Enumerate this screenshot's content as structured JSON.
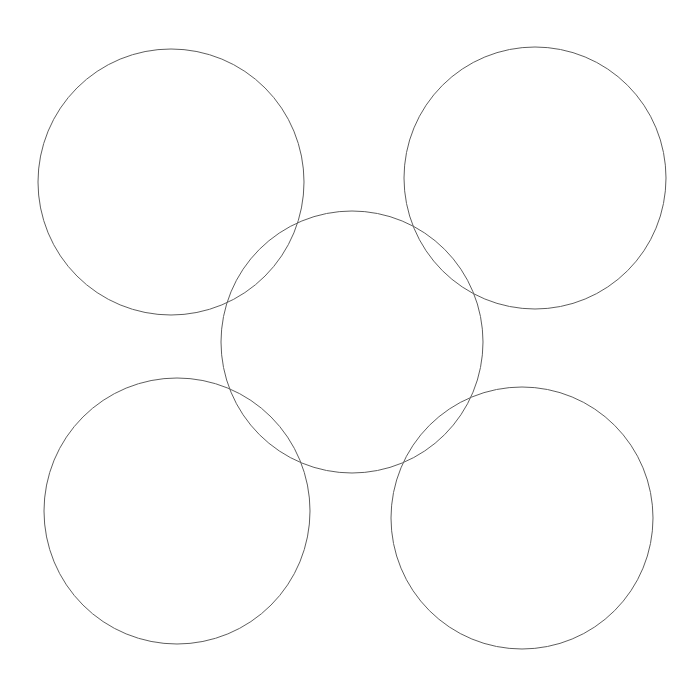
{
  "diagram": {
    "type": "overlapping-circles",
    "arrangement": "quincunx",
    "canvas": {
      "width": 695,
      "height": 686,
      "background": "#ffffff"
    },
    "stroke": {
      "color": "#5f5f5f",
      "width": 1
    },
    "fill": "none",
    "circles": [
      {
        "id": "top-left",
        "cx": 171,
        "cy": 182,
        "r": 133
      },
      {
        "id": "top-right",
        "cx": 535,
        "cy": 178,
        "r": 131
      },
      {
        "id": "center",
        "cx": 352,
        "cy": 342,
        "r": 131
      },
      {
        "id": "bottom-left",
        "cx": 177,
        "cy": 511,
        "r": 133
      },
      {
        "id": "bottom-right",
        "cx": 522,
        "cy": 518,
        "r": 131
      }
    ]
  }
}
